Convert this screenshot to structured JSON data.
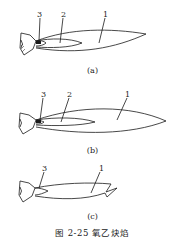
{
  "figure": {
    "caption": "图 2-25  氧乙炔焰",
    "panels": [
      {
        "id": "a",
        "label": "(a)",
        "zones": [
          {
            "num": "3"
          },
          {
            "num": "2"
          },
          {
            "num": "1"
          }
        ]
      },
      {
        "id": "b",
        "label": "(b)",
        "zones": [
          {
            "num": "3"
          },
          {
            "num": "2"
          },
          {
            "num": "1"
          }
        ]
      },
      {
        "id": "c",
        "label": "(c)",
        "zones": [
          {
            "num": "3"
          },
          {
            "num": "1"
          }
        ]
      }
    ],
    "colors": {
      "line": "#1a1a1a",
      "background": "#ffffff"
    }
  }
}
